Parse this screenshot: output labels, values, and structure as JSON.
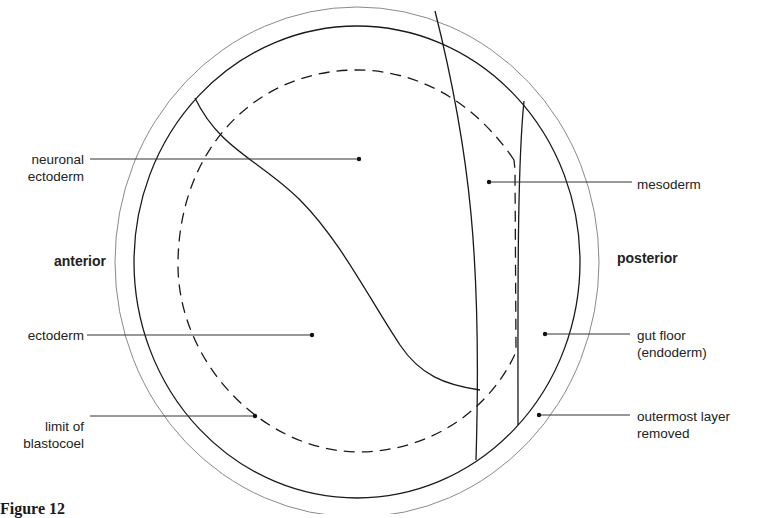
{
  "figure": {
    "caption": "Figure 12",
    "orientation": {
      "left": "anterior",
      "right": "posterior"
    },
    "labels": {
      "neuronal_ectoderm": [
        "neuronal",
        "ectoderm"
      ],
      "ectoderm": "ectoderm",
      "limit_of_blastocoel": [
        "limit of",
        "blastocoel"
      ],
      "mesoderm": "mesoderm",
      "gut_floor": [
        "gut floor",
        "(endoderm)"
      ],
      "outermost_layer": [
        "outermost layer",
        "removed"
      ]
    },
    "colors": {
      "line": "#1a1a1a",
      "outer_ring": "#8a8a8a"
    }
  }
}
